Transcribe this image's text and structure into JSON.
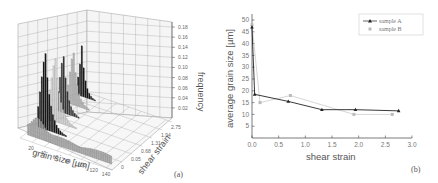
{
  "chart_data": [
    {
      "panel": "(a)",
      "type": "bar3d",
      "title": "",
      "xlabel": "grain size [µm]",
      "ylabel": "shear strain",
      "zlabel": "frequency",
      "x_ticks": [
        "20",
        "40",
        "60",
        "80",
        "100",
        "120",
        "140"
      ],
      "y_ticks": [
        "0",
        "0.05",
        "0.68",
        "1.31",
        "1.94",
        "2.75"
      ],
      "z_ticks": [
        "0.02",
        "0.04",
        "0.06",
        "0.08",
        "0.10",
        "0.12",
        "0.14",
        "0.16",
        "0.18"
      ],
      "zlim": [
        0,
        0.19
      ],
      "series": [
        {
          "name": "0",
          "color": "#aaaaaa",
          "peak_grain_size": 20,
          "peak_frequency": 0.04
        },
        {
          "name": "0.05",
          "color": "#111111",
          "peak_grain_size": 15,
          "peak_frequency": 0.17
        },
        {
          "name": "0.68",
          "color": "#dddddd",
          "peak_grain_size": 15,
          "peak_frequency": 0.14
        },
        {
          "name": "1.31",
          "color": "#333333",
          "peak_grain_size": 12,
          "peak_frequency": 0.13
        },
        {
          "name": "1.94",
          "color": "#bbbbbb",
          "peak_grain_size": 12,
          "peak_frequency": 0.12
        },
        {
          "name": "2.75",
          "color": "#111111",
          "peak_grain_size": 10,
          "peak_frequency": 0.1
        }
      ]
    },
    {
      "panel": "(b)",
      "type": "line",
      "title": "",
      "xlabel": "shear strain",
      "ylabel": "average grain size [µm]",
      "xlim": [
        0,
        3.0
      ],
      "ylim": [
        0,
        52
      ],
      "x_ticks": [
        "0.0",
        "0.5",
        "1.0",
        "1.5",
        "2.0",
        "2.5",
        "3.0"
      ],
      "y_ticks": [
        "5",
        "10",
        "15",
        "20",
        "25",
        "30",
        "35",
        "40",
        "45",
        "50"
      ],
      "legend_position": "upper right",
      "grid": false,
      "series": [
        {
          "name": "sample A",
          "marker": "triangle",
          "color": "#222222",
          "x": [
            0,
            0.05,
            0.68,
            1.31,
            1.94,
            2.75
          ],
          "y": [
            47,
            18.5,
            15.5,
            12,
            12,
            11.5
          ]
        },
        {
          "name": "sample B",
          "marker": "square",
          "color": "#bbbbbb",
          "x": [
            0,
            0.15,
            0.72,
            1.91,
            2.63
          ],
          "y": [
            48,
            15,
            18,
            10,
            10
          ]
        }
      ]
    }
  ],
  "labels": {
    "panel_a": "(a)",
    "panel_b": "(b)",
    "a_xlabel": "grain size [µm]",
    "a_ylabel": "shear strain",
    "a_zlabel": "frequency",
    "b_xlabel": "shear strain",
    "b_ylabel": "average grain size [µm]",
    "legend_a": "sample A",
    "legend_b": "sample B"
  }
}
